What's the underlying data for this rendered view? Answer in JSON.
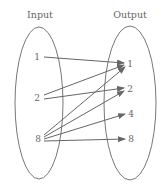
{
  "diagram": {
    "title_input": "Input",
    "title_output": "Output",
    "inputs": [
      {
        "label": "1",
        "x": 37,
        "y": 57
      },
      {
        "label": "2",
        "x": 37,
        "y": 98
      },
      {
        "label": "8",
        "x": 38,
        "y": 139
      }
    ],
    "outputs": [
      {
        "label": "1",
        "x": 130,
        "y": 64
      },
      {
        "label": "2",
        "x": 130,
        "y": 89
      },
      {
        "label": "4",
        "x": 131,
        "y": 114
      },
      {
        "label": "8",
        "x": 131,
        "y": 139
      }
    ],
    "mappings": [
      {
        "from": "1",
        "to": "1"
      },
      {
        "from": "2",
        "to": "1"
      },
      {
        "from": "2",
        "to": "2"
      },
      {
        "from": "8",
        "to": "1"
      },
      {
        "from": "8",
        "to": "2"
      },
      {
        "from": "8",
        "to": "4"
      },
      {
        "from": "8",
        "to": "8"
      }
    ],
    "colors": {
      "stroke": "#777777",
      "text": "#666666"
    }
  }
}
